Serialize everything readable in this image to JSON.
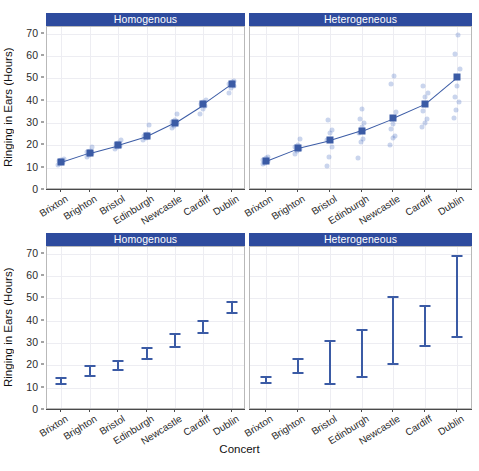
{
  "figure": {
    "xlabel": "Concert",
    "ylabel": "Ringing in Ears (Hours)"
  },
  "chart_data": [
    {
      "type": "scatter",
      "id": "top",
      "title": "",
      "xlabel": "",
      "ylabel": "Ringing in Ears (Hours)",
      "ylim": [
        0,
        73
      ],
      "yticks": [
        0,
        10,
        20,
        30,
        40,
        50,
        60,
        70
      ],
      "grid": true,
      "legend": "none",
      "categories": [
        "Brixton",
        "Brighton",
        "Bristol",
        "Edinburgh",
        "Newcastle",
        "Cardiff",
        "Dublin"
      ],
      "panels": [
        {
          "label": "Homogenous",
          "mean_marker": "square",
          "connected_line": true,
          "means": [
            12.5,
            16.7,
            20.1,
            24.0,
            30.2,
            38.3,
            47.3
          ],
          "raw_points": [
            [
              11.2,
              12.0,
              12.4,
              12.8,
              13.3,
              13.9
            ],
            [
              14.9,
              15.6,
              16.4,
              17.0,
              17.6,
              19.3
            ],
            [
              18.2,
              19.1,
              19.8,
              20.4,
              21.2,
              22.3
            ],
            [
              22.3,
              23.2,
              23.8,
              24.3,
              25.1,
              28.9
            ],
            [
              27.6,
              28.8,
              29.8,
              30.6,
              31.5,
              33.9
            ],
            [
              34.2,
              36.2,
              37.6,
              38.6,
              39.4,
              40.2
            ],
            [
              43.5,
              45.6,
              46.8,
              47.6,
              48.2,
              48.9
            ]
          ]
        },
        {
          "label": "Heterogeneous",
          "mean_marker": "square",
          "connected_line": true,
          "means": [
            13.2,
            18.8,
            22.2,
            26.6,
            32.3,
            38.6,
            50.5
          ],
          "raw_points": [
            [
              11.5,
              12.3,
              13.0,
              13.6,
              14.2,
              15.0
            ],
            [
              16.1,
              17.3,
              18.4,
              19.2,
              20.2,
              22.8
            ],
            [
              10.9,
              14.7,
              19.2,
              22.6,
              25.4,
              27.0,
              31.3
            ],
            [
              14.4,
              21.3,
              23.0,
              25.7,
              28.0,
              30.2,
              31.9,
              36.4
            ],
            [
              20.2,
              23.3,
              24.4,
              27.1,
              29.4,
              34.8,
              47.3,
              50.9
            ],
            [
              28.3,
              30.1,
              31.7,
              35.2,
              41.5,
              43.3,
              46.6
            ],
            [
              32.3,
              35.7,
              39.5,
              41.7,
              46.4,
              54.3,
              60.7,
              69.6
            ]
          ]
        }
      ]
    },
    {
      "type": "line",
      "id": "bottom",
      "title": "",
      "xlabel": "Concert",
      "ylabel": "Ringing in Ears (Hours)",
      "ylim": [
        0,
        73
      ],
      "yticks": [
        0,
        10,
        20,
        30,
        40,
        50,
        60,
        70
      ],
      "grid": true,
      "legend": "none",
      "categories": [
        "Brixton",
        "Brighton",
        "Bristol",
        "Edinburgh",
        "Newcastle",
        "Cardiff",
        "Dublin"
      ],
      "panels": [
        {
          "label": "Homogenous",
          "interval_kind": "error-bar",
          "lower": [
            11.4,
            14.6,
            17.3,
            22.6,
            27.7,
            34.2,
            43.1
          ],
          "upper": [
            15.0,
            20.3,
            22.4,
            28.4,
            34.5,
            40.5,
            49.0
          ]
        },
        {
          "label": "Heterogeneous",
          "interval_kind": "error-bar",
          "lower": [
            11.6,
            16.3,
            11.1,
            14.4,
            20.2,
            28.3,
            32.3
          ],
          "upper": [
            15.1,
            23.2,
            31.3,
            36.5,
            50.9,
            46.9,
            69.6
          ]
        }
      ]
    }
  ]
}
